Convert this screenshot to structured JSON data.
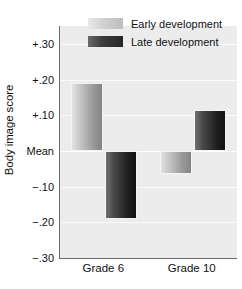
{
  "chart_data": {
    "type": "bar",
    "title": "",
    "xlabel": "",
    "ylabel": "Body image score",
    "categories": [
      "Grade 6",
      "Grade 10"
    ],
    "series": [
      {
        "name": "Early development",
        "values": [
          0.19,
          -0.065
        ]
      },
      {
        "name": "Late development",
        "values": [
          -0.19,
          0.115
        ]
      }
    ],
    "ylim": [
      -0.3,
      0.35
    ],
    "baseline": 0,
    "baseline_label": "Mean",
    "grid": true,
    "legend_position": "top-right",
    "yticks": [
      {
        "value": 0.3,
        "label": "+.30"
      },
      {
        "value": 0.2,
        "label": "+.20"
      },
      {
        "value": 0.1,
        "label": "+.10"
      },
      {
        "value": 0.0,
        "label": "Mean"
      },
      {
        "value": -0.1,
        "label": "−.10"
      },
      {
        "value": -0.2,
        "label": "−.20"
      },
      {
        "value": -0.3,
        "label": "−.30"
      }
    ],
    "colors": {
      "early_light": "#e3e3e3",
      "early_dark": "#848484",
      "late_light": "#6f6f6f",
      "late_dark": "#111111",
      "plot_background": "#ececed",
      "axis": "#6b6b6b",
      "gridline": "#fafafa",
      "text": "#111111"
    }
  },
  "legend": {
    "items": [
      {
        "label": "Early development",
        "swatch": "early"
      },
      {
        "label": "Late development",
        "swatch": "late"
      }
    ]
  }
}
